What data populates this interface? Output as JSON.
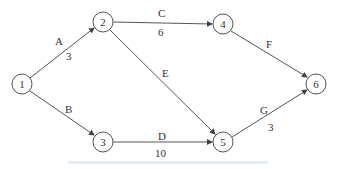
{
  "diagram": {
    "type": "activity-on-arrow network",
    "nodes": [
      {
        "id": "1",
        "label": "1",
        "x": 22,
        "y": 84
      },
      {
        "id": "2",
        "label": "2",
        "x": 103,
        "y": 22
      },
      {
        "id": "3",
        "label": "3",
        "x": 103,
        "y": 142
      },
      {
        "id": "4",
        "label": "4",
        "x": 223,
        "y": 24
      },
      {
        "id": "5",
        "label": "5",
        "x": 223,
        "y": 142
      },
      {
        "id": "6",
        "label": "6",
        "x": 316,
        "y": 84
      }
    ],
    "edges": [
      {
        "from": "1",
        "to": "2",
        "activity": "A",
        "duration": "3"
      },
      {
        "from": "1",
        "to": "3",
        "activity": "B",
        "duration": ""
      },
      {
        "from": "2",
        "to": "4",
        "activity": "C",
        "duration": "6"
      },
      {
        "from": "3",
        "to": "5",
        "activity": "D",
        "duration": "10"
      },
      {
        "from": "2",
        "to": "5",
        "activity": "E",
        "duration": ""
      },
      {
        "from": "4",
        "to": "6",
        "activity": "F",
        "duration": ""
      },
      {
        "from": "5",
        "to": "6",
        "activity": "G",
        "duration": "3"
      }
    ]
  }
}
